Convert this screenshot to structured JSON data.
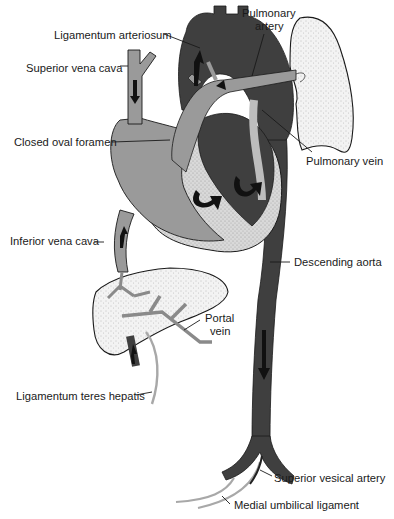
{
  "figure": {
    "colors": {
      "oxygenated_dark": "#3f3f3f",
      "deoxygenated_gray": "#9a9a9a",
      "myocardium_stipple": "#d4d4d4",
      "organ_fill": "#f1f1f1",
      "ligament": "#b0b0b0",
      "arrow": "#111111"
    }
  },
  "labels": {
    "ligamentum_arteriosum": "Ligamentum arteriosum",
    "pulmonary_artery_line1": "Pulmonary",
    "pulmonary_artery_line2": "artery",
    "superior_vena_cava": "Superior vena cava",
    "closed_oval_foramen": "Closed oval foramen",
    "pulmonary_vein": "Pulmonary vein",
    "inferior_vena_cava": "Inferior vena cava",
    "descending_aorta": "Descending aorta",
    "portal_vein_line1": "Portal",
    "portal_vein_line2": "vein",
    "ligamentum_teres_hepatis": "Ligamentum teres hepatis",
    "superior_vesical_artery": "Superior vesical artery",
    "medial_umbilical_ligament": "Medial umbilical ligament"
  },
  "structures": [
    "heart",
    "aorta",
    "pulmonary-artery",
    "lung",
    "liver",
    "superior-vena-cava",
    "inferior-vena-cava",
    "portal-vein",
    "descending-aorta",
    "iliac-arteries",
    "umbilical-ligaments"
  ]
}
